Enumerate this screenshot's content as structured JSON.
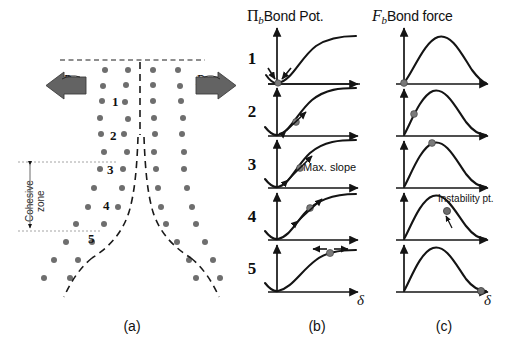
{
  "figure": {
    "width": 507,
    "height": 350,
    "background": "#ffffff",
    "ink_color": "#141414",
    "atom_color": "#6e6e6e",
    "arrow_color": "#5a5a5a",
    "dashed_color": "#1f1f1f"
  },
  "panels": [
    {
      "id": "a",
      "caption": "(a)",
      "description": "atomistic crack with cohesive zone"
    },
    {
      "id": "b",
      "caption": "(b)",
      "description": "bond potential curves"
    },
    {
      "id": "c",
      "caption": "(c)",
      "description": "bond force curves"
    }
  ],
  "headers": {
    "bond_potential": {
      "symbol": "Π",
      "subscript": "b",
      "text": "Bond Pot."
    },
    "bond_force": {
      "symbol": "F",
      "subscript": "b",
      "text": "Bond force"
    }
  },
  "axis_labels": {
    "x_symbol": "δ",
    "column_b_x": "δ",
    "column_c_x": "δ"
  },
  "panel_a": {
    "load_left": "P",
    "load_right": "P",
    "cohesive_zone_line1": "Cohesive",
    "cohesive_zone_line2": "zone",
    "lattice_labels": [
      "1",
      "2",
      "3",
      "4",
      "5"
    ],
    "atom_positions": [
      [
        105,
        70
      ],
      [
        128,
        70
      ],
      [
        153,
        70
      ],
      [
        178,
        70
      ],
      [
        103,
        86
      ],
      [
        126,
        85
      ],
      [
        153,
        85
      ],
      [
        180,
        86
      ],
      [
        102,
        101
      ],
      [
        125,
        102
      ],
      [
        153,
        101
      ],
      [
        181,
        101
      ],
      [
        100,
        118
      ],
      [
        128,
        119
      ],
      [
        154,
        118
      ],
      [
        183,
        118
      ],
      [
        101,
        134
      ],
      [
        124,
        134
      ],
      [
        155,
        134
      ],
      [
        182,
        134
      ],
      [
        104,
        152
      ],
      [
        127,
        152
      ],
      [
        154,
        152
      ],
      [
        184,
        152
      ],
      [
        100,
        169
      ],
      [
        123,
        169
      ],
      [
        156,
        169
      ],
      [
        184,
        169
      ],
      [
        94,
        188
      ],
      [
        122,
        188
      ],
      [
        158,
        188
      ],
      [
        187,
        188
      ],
      [
        88,
        207
      ],
      [
        118,
        207
      ],
      [
        161,
        207
      ],
      [
        192,
        207
      ],
      [
        76,
        224
      ],
      [
        104,
        224
      ],
      [
        166,
        224
      ],
      [
        196,
        224
      ],
      [
        66,
        242
      ],
      [
        92,
        242
      ],
      [
        177,
        242
      ],
      [
        205,
        242
      ],
      [
        54,
        260
      ],
      [
        78,
        260
      ],
      [
        189,
        260
      ],
      [
        213,
        260
      ],
      [
        44,
        278
      ],
      [
        70,
        278
      ],
      [
        196,
        278
      ],
      [
        220,
        278
      ]
    ]
  },
  "rows": [
    {
      "index": "1",
      "potential_note": null,
      "force_note": null,
      "potential_marker_x_frac": 0.06,
      "force_marker_x_frac": 0.0,
      "arrow_mode": "converging"
    },
    {
      "index": "2",
      "potential_note": null,
      "force_note": null,
      "potential_marker_x_frac": 0.3,
      "force_marker_x_frac": 0.2,
      "arrow_mode": "up-slope"
    },
    {
      "index": "3",
      "potential_note": "Max. slope",
      "force_note": null,
      "potential_marker_x_frac": 0.38,
      "force_marker_x_frac": 0.38,
      "arrow_mode": "up-slope"
    },
    {
      "index": "4",
      "potential_note": null,
      "force_note_line1": "Instability",
      "force_note_line2": "pt.",
      "potential_marker_x_frac": 0.55,
      "force_marker_x_frac": 0.58,
      "arrow_mode": "up-slope"
    },
    {
      "index": "5",
      "potential_note": null,
      "force_note": null,
      "potential_marker_x_frac": 0.78,
      "force_marker_x_frac": 0.95,
      "arrow_mode": "diverging"
    }
  ],
  "chart_data": {
    "type": "line",
    "xlabel": "δ",
    "series_groups": [
      {
        "name": "Bond Pot.",
        "ylabel": "Π_b",
        "shape": "monotonic rising sigmoid from minimum well to plateau",
        "marker_positions": [
          0.06,
          0.3,
          0.38,
          0.55,
          0.78
        ],
        "annotations": [
          "Max. slope at row 3"
        ]
      },
      {
        "name": "Bond force",
        "ylabel": "F_b",
        "shape": "rise to peak then decaying tail to zero",
        "marker_positions": [
          0.0,
          0.2,
          0.38,
          0.58,
          0.95
        ],
        "annotations": [
          "Instability pt. at row 4"
        ]
      }
    ]
  }
}
